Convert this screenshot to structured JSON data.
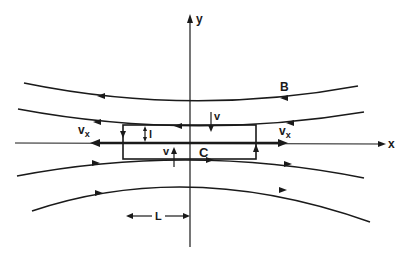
{
  "diagram": {
    "type": "magnetic-field-line-diagram",
    "colors": {
      "ink": "#1a1a1a",
      "background": "#ffffff"
    },
    "axes": {
      "x_label": "x",
      "y_label": "y"
    },
    "labels": {
      "field": "B",
      "velocity_top": "v",
      "velocity_bottom": "v",
      "vx_left_main": "v",
      "vx_left_sub": "x",
      "vx_right_main": "v",
      "vx_right_sub": "x",
      "thickness": "l",
      "contour": "C",
      "length": "L"
    },
    "field_lines": [
      {
        "name": "field-line-1",
        "direction": "leftward"
      },
      {
        "name": "field-line-2",
        "direction": "leftward"
      },
      {
        "name": "field-line-3",
        "direction": "rightward"
      },
      {
        "name": "field-line-4",
        "direction": "rightward"
      }
    ],
    "contour_box": {
      "label": "C",
      "circulation": "counter-clockwise"
    }
  }
}
